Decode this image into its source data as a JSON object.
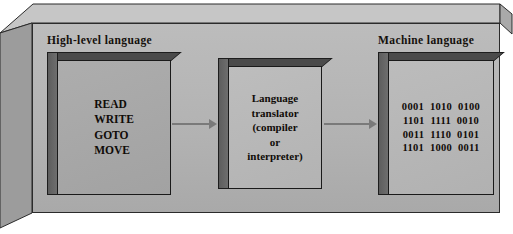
{
  "diagram": {
    "type": "process-flow",
    "labels": {
      "high_level": "High-level language",
      "machine": "Machine language"
    },
    "boxes": [
      {
        "id": "high-level-language",
        "label": "High-level language",
        "lines": [
          "READ",
          "WRITE",
          "GOTO",
          "MOVE"
        ],
        "text": "READ\nWRITE\nGOTO\nMOVE",
        "align": "left"
      },
      {
        "id": "language-translator",
        "label": "",
        "lines": [
          "Language",
          "translator",
          "(compiler",
          "or",
          "interpreter)"
        ],
        "text": "Language\ntranslator\n(compiler\nor\ninterpreter)",
        "align": "center"
      },
      {
        "id": "machine-language",
        "label": "Machine language",
        "lines": [
          "0001  1010  0100",
          "1101  1111  0010",
          "0011  1110  0101",
          "1101  1000  0011"
        ],
        "text": "0001  1010  0100\n1101  1111  0010\n0011  1110  0101\n1101  1000  0011",
        "align": "center"
      }
    ],
    "arrows": [
      {
        "id": "arrow-high-to-translator",
        "from": "high-level-language",
        "to": "language-translator",
        "direction": "right"
      },
      {
        "id": "arrow-translator-to-machine",
        "from": "language-translator",
        "to": "machine-language",
        "direction": "right"
      }
    ],
    "colors": {
      "panel_background": "#b4b4b4",
      "box_front": "#b3b3b3",
      "box_side": "#5d5d5d",
      "outline": "#1a1a1a",
      "arrow": "#7a7a7a",
      "text": "#100c08"
    }
  }
}
